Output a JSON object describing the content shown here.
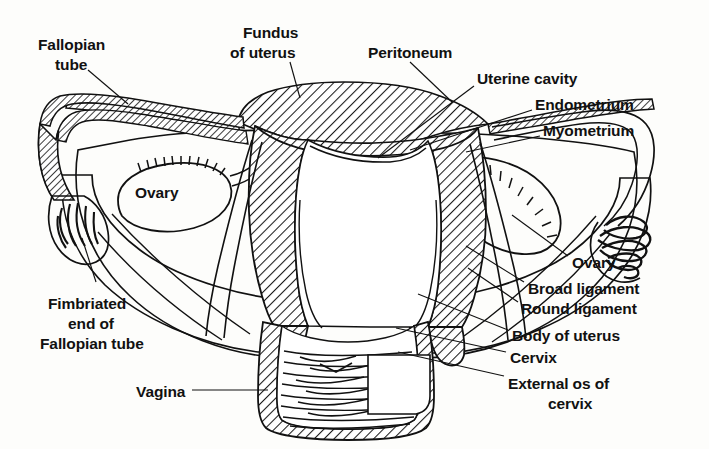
{
  "figure": {
    "background_color": "#fdfdfb",
    "ink_color": "#111111",
    "style": "black-and-white line drawing with diagonal hatching"
  },
  "labels": {
    "fallopian_tube": {
      "text_lines": [
        "Fallopian",
        "tube"
      ],
      "x": 38,
      "y": 38,
      "align": "start"
    },
    "fundus_of_uterus": {
      "text_lines": [
        "Fundus",
        "of uterus"
      ],
      "x": 238,
      "y": 28,
      "align": "start"
    },
    "peritoneum": {
      "text_lines": [
        "Peritoneum"
      ],
      "x": 368,
      "y": 50,
      "align": "start"
    },
    "uterine_cavity": {
      "text_lines": [
        "Uterine cavity"
      ],
      "x": 477,
      "y": 77,
      "align": "start"
    },
    "endometrium": {
      "text_lines": [
        "Endometrium"
      ],
      "x": 535,
      "y": 103,
      "align": "start"
    },
    "myometrium": {
      "text_lines": [
        "Myometrium"
      ],
      "x": 543,
      "y": 129,
      "align": "start"
    },
    "ovary_left": {
      "text_lines": [
        "Ovary"
      ],
      "x": 135,
      "y": 192,
      "align": "start"
    },
    "ovary_right": {
      "text_lines": [
        "Ovary"
      ],
      "x": 572,
      "y": 262,
      "align": "start"
    },
    "broad_ligament": {
      "text_lines": [
        "Broad ligament"
      ],
      "x": 528,
      "y": 288,
      "align": "start"
    },
    "round_ligament": {
      "text_lines": [
        "Round ligament"
      ],
      "x": 521,
      "y": 308,
      "align": "start"
    },
    "body_of_uterus": {
      "text_lines": [
        "Body of uterus"
      ],
      "x": 512,
      "y": 335,
      "align": "start"
    },
    "cervix": {
      "text_lines": [
        "Cervix"
      ],
      "x": 510,
      "y": 357,
      "align": "start"
    },
    "external_os_of_cervix": {
      "text_lines": [
        "External os of",
        "cervix"
      ],
      "x": 508,
      "y": 383,
      "align": "start"
    },
    "fimbriated_end": {
      "text_lines": [
        "Fimbriated",
        "end of",
        "Fallopian tube"
      ],
      "x": 42,
      "y": 303,
      "align": "start"
    },
    "vagina": {
      "text_lines": [
        "Vagina"
      ],
      "x": 136,
      "y": 394,
      "align": "start"
    }
  },
  "structures": [
    {
      "name": "fundus-of-uterus",
      "description": "hatched dome at top of uterus"
    },
    {
      "name": "peritoneum",
      "description": "hatched serosal covering draping over fundus and broad ligament"
    },
    {
      "name": "myometrium",
      "description": "thick hatched muscular uterine wall"
    },
    {
      "name": "endometrium",
      "description": "inner lining bordering the uterine cavity"
    },
    {
      "name": "uterine-cavity",
      "description": "white triangular cavity inside the uterus"
    },
    {
      "name": "fallopian-tube-left",
      "description": "hatched tube running laterally from the uterine cornu"
    },
    {
      "name": "fallopian-tube-right",
      "description": "tube running laterally to the right fimbriae"
    },
    {
      "name": "fimbriae-left",
      "description": "finger-like projections at the left tubal end"
    },
    {
      "name": "fimbriae-right",
      "description": "finger-like projections at the right tubal end"
    },
    {
      "name": "ovary-left",
      "description": "oval organ with combed hilum on the left"
    },
    {
      "name": "ovary-right",
      "description": "oval organ with combed hilum on the right"
    },
    {
      "name": "broad-ligament",
      "description": "wing-like peritoneal fold spanning from uterus to pelvic wall"
    },
    {
      "name": "round-ligament",
      "description": "cord running anterolaterally from the uterine cornu"
    },
    {
      "name": "body-of-uterus",
      "description": "main hatched body of the uterus"
    },
    {
      "name": "cervix",
      "description": "narrow lower uterine segment projecting into the vagina"
    },
    {
      "name": "external-os",
      "description": "opening of the cervix into the vagina"
    },
    {
      "name": "vagina",
      "description": "hatched-walled canal with transverse rugae below the cervix"
    }
  ]
}
